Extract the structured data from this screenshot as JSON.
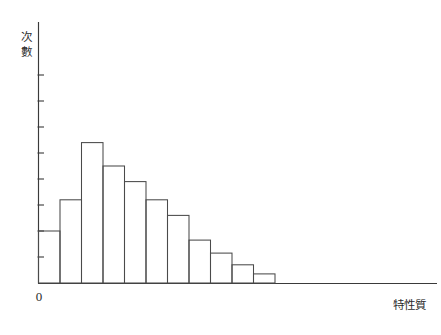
{
  "chart_data": {
    "type": "bar",
    "title": "",
    "subtitle": "",
    "xlabel": "特性質",
    "ylabel": "次數",
    "origin_label": "0",
    "categories": [
      "1",
      "2",
      "3",
      "4",
      "5",
      "6",
      "7",
      "8",
      "9",
      "10",
      "11"
    ],
    "values": [
      2.0,
      3.2,
      5.4,
      4.5,
      3.9,
      3.2,
      2.6,
      1.65,
      1.15,
      0.7,
      0.35
    ],
    "xlim": [
      0,
      15.7
    ],
    "ylim": [
      0,
      10.0
    ],
    "y_tick_count": 8,
    "y_tick_step": 1,
    "x_ticks_shown": false,
    "grid": false,
    "legend": null,
    "bar_fill": "none",
    "bar_stroke": "#4a4a4a",
    "axis_color": "#3a3a3a",
    "background": "#ffffff",
    "distribution_shape": "right-skewed",
    "annotations": []
  },
  "figure": {
    "width": 441,
    "height": 335,
    "plot_left": 38,
    "plot_baseline": 283,
    "plot_top": 22,
    "x_axis_right": 437
  }
}
